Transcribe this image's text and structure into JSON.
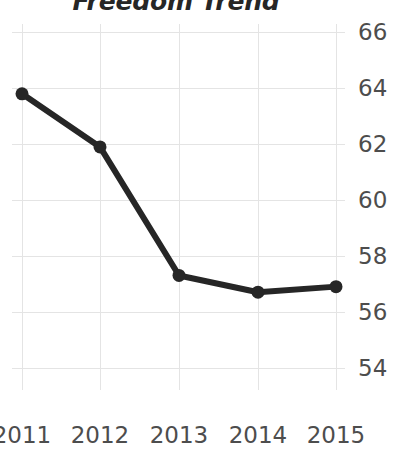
{
  "chart_data": {
    "type": "line",
    "title": "Freedom Trend",
    "xlabel": "",
    "ylabel": "",
    "categories": [
      "2011",
      "2012",
      "2013",
      "2014",
      "2015"
    ],
    "x": [
      2011,
      2012,
      2013,
      2014,
      2015
    ],
    "values": [
      63.8,
      61.9,
      57.3,
      56.7,
      56.9
    ],
    "series": [
      {
        "name": "Freedom Score",
        "values": [
          63.8,
          61.9,
          57.3,
          56.7,
          56.9
        ]
      }
    ],
    "ylim": [
      53.2,
      66.3
    ],
    "yticks": [
      54,
      56,
      58,
      60,
      62,
      64,
      66
    ],
    "ytick_labels": [
      "54",
      "56",
      "58",
      "60",
      "62",
      "64",
      "66"
    ],
    "xtick_labels": [
      "2011",
      "2012",
      "2013",
      "2014",
      "2015"
    ],
    "grid": true,
    "grid_color": "#e4e4e4",
    "legend": false,
    "legend_position": "none",
    "line_color": "#262626",
    "marker_color": "#262626",
    "marker": "circle",
    "y_axis_side": "right",
    "background_color": "#ffffff",
    "tick_label_color": "#4d4d4d",
    "title_color": "#262626"
  }
}
